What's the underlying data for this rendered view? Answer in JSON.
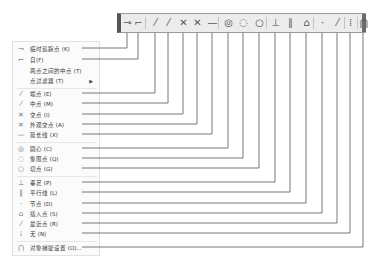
{
  "toolbar": {
    "buttons": [
      {
        "name": "temporary-track-point",
        "glyph": "⊸",
        "x": 127
      },
      {
        "name": "from",
        "glyph": "⌐",
        "x": 138
      },
      {
        "name": "endpoint",
        "glyph": "⁄",
        "x": 155
      },
      {
        "name": "midpoint",
        "glyph": "⁄",
        "x": 168
      },
      {
        "name": "intersection",
        "glyph": "✕",
        "x": 183
      },
      {
        "name": "apparent-intersection",
        "glyph": "✕",
        "x": 197
      },
      {
        "name": "extension",
        "glyph": "—",
        "x": 212
      },
      {
        "name": "center",
        "glyph": "◎",
        "x": 228
      },
      {
        "name": "quadrant",
        "glyph": "◌",
        "x": 243
      },
      {
        "name": "tangent",
        "glyph": "○",
        "x": 259
      },
      {
        "name": "perpendicular",
        "glyph": "⊥",
        "x": 275
      },
      {
        "name": "parallel",
        "glyph": "∥",
        "x": 290
      },
      {
        "name": "insertion",
        "glyph": "⌂",
        "x": 306
      },
      {
        "name": "node",
        "glyph": "·",
        "x": 322
      },
      {
        "name": "nearest",
        "glyph": "⁄",
        "x": 337
      },
      {
        "name": "none",
        "glyph": "⁞",
        "x": 350
      },
      {
        "name": "osnap-settings",
        "glyph": "⋂",
        "x": 363
      }
    ]
  },
  "menu": {
    "items": [
      {
        "icon": "⊸",
        "label": "临时追踪点 (K)",
        "y": 48,
        "col": 127
      },
      {
        "icon": "⌐",
        "label": "自(F)",
        "y": 59,
        "col": 138
      },
      {
        "icon": "",
        "label": "两点之间的中点 (T)",
        "y": 70
      },
      {
        "icon": "",
        "label": "点过滤器 (T)",
        "y": 80,
        "submenu": true
      },
      {
        "icon": "⁄",
        "label": "端点 (E)",
        "y": 93,
        "col": 155
      },
      {
        "icon": "⁄",
        "label": "中点 (M)",
        "y": 103,
        "col": 168
      },
      {
        "icon": "✕",
        "label": "交点 (I)",
        "y": 114,
        "col": 183
      },
      {
        "icon": "✕",
        "label": "外观交点 (A)",
        "y": 124,
        "col": 197
      },
      {
        "icon": "—",
        "label": "延长线 (X)",
        "y": 134,
        "col": 212
      },
      {
        "icon": "◎",
        "label": "圆心 (C)",
        "y": 148,
        "col": 228
      },
      {
        "icon": "◌",
        "label": "象限点 (Q)",
        "y": 158,
        "col": 243
      },
      {
        "icon": "○",
        "label": "切点 (G)",
        "y": 168,
        "col": 259
      },
      {
        "icon": "⊥",
        "label": "垂足 (P)",
        "y": 182,
        "col": 275
      },
      {
        "icon": "∥",
        "label": "平行线 (L)",
        "y": 192,
        "col": 290
      },
      {
        "icon": "·",
        "label": "节点 (D)",
        "y": 203,
        "col": 306
      },
      {
        "icon": "⌂",
        "label": "插入点 (S)",
        "y": 213,
        "col": 322
      },
      {
        "icon": "⁄",
        "label": "最近点 (R)",
        "y": 223,
        "col": 337
      },
      {
        "icon": "⁞",
        "label": "无 (N)",
        "y": 233,
        "col": 350
      },
      {
        "icon": "⋂",
        "label": "对象捕捉设置 (O)...",
        "y": 247,
        "col": 363
      }
    ],
    "separators_y": [
      87,
      141,
      175,
      240
    ]
  },
  "colors": {
    "line": "#555555",
    "toolbar_bg": "#ececec"
  }
}
